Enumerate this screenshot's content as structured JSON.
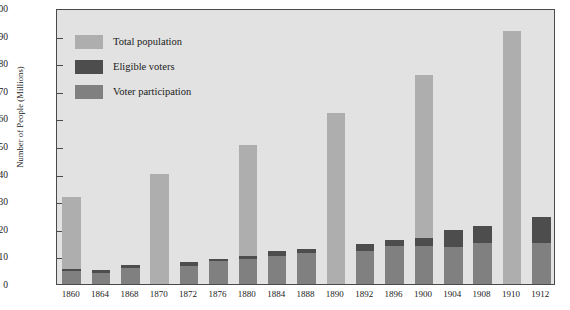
{
  "chart_data": {
    "type": "bar",
    "title": "",
    "xlabel": "",
    "ylabel": "Number of People (Millions)",
    "ylim": [
      0,
      100
    ],
    "yticks": [
      0,
      10,
      20,
      30,
      40,
      50,
      60,
      70,
      80,
      90,
      100
    ],
    "grid": false,
    "legend_position": "upper-left inside plot",
    "stacked_overlay": true,
    "categories": [
      "1860",
      "1864",
      "1868",
      "1870",
      "1872",
      "1876",
      "1880",
      "1884",
      "1888",
      "1890",
      "1892",
      "1896",
      "1900",
      "1904",
      "1908",
      "1910",
      "1912"
    ],
    "series": [
      {
        "name": "Total population",
        "color": "#aeaeae",
        "values": [
          31.4,
          null,
          null,
          39.8,
          null,
          null,
          50.2,
          null,
          null,
          62.1,
          null,
          null,
          75.6,
          null,
          null,
          91.6,
          null
        ]
      },
      {
        "name": "Eligible voters",
        "color": "#4d4d4d",
        "values": [
          5.4,
          5.0,
          7.0,
          null,
          8.0,
          9.1,
          10.2,
          11.8,
          12.8,
          null,
          14.5,
          15.9,
          16.6,
          19.4,
          21.2,
          null,
          24.2
        ]
      },
      {
        "name": "Voter participation",
        "color": "#808080",
        "values": [
          4.7,
          4.0,
          5.7,
          null,
          6.5,
          8.4,
          9.2,
          10.1,
          11.4,
          null,
          12.1,
          13.6,
          13.9,
          13.5,
          14.9,
          null,
          15.0
        ]
      }
    ],
    "legend": [
      {
        "label": "Total population",
        "color": "#aeaeae"
      },
      {
        "label": "Eligible voters",
        "color": "#4d4d4d"
      },
      {
        "label": "Voter participation",
        "color": "#808080"
      }
    ]
  }
}
